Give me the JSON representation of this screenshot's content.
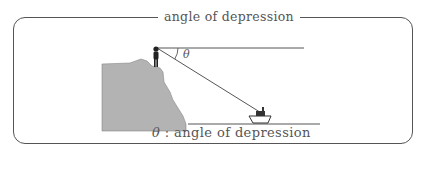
{
  "diagram": {
    "title": "angle of depression",
    "angle_label": "θ",
    "caption_symbol": "θ",
    "caption_text": " : angle of depression",
    "elements": [
      "cliff",
      "observer",
      "horizontal line",
      "line of sight",
      "boat",
      "sea level line"
    ],
    "colors": {
      "line": "#555555",
      "cliff_fill": "#b3b3b3",
      "figure": "#222222"
    }
  }
}
